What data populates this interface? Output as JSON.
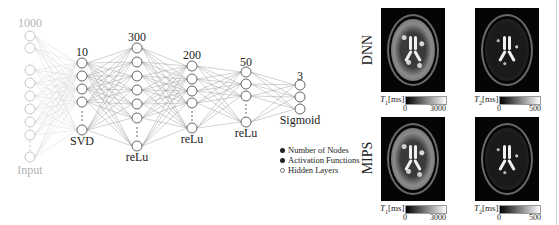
{
  "network": {
    "layers": [
      {
        "id": "input",
        "top_label": "1000",
        "bottom_label": "Input",
        "x": 30,
        "nodes": [
          36,
          48,
          70,
          83,
          96,
          109,
          122,
          135
        ],
        "dots_y": 146,
        "last_node": 157,
        "faded": true
      },
      {
        "id": "svd",
        "top_label": "10",
        "bottom_label": "SVD",
        "x": 82,
        "nodes": [
          63,
          76,
          89,
          102
        ],
        "dots_y": 116,
        "last_node": 130,
        "faded": false
      },
      {
        "id": "relu1",
        "top_label": "300",
        "bottom_label": "reLu",
        "x": 137,
        "nodes": [
          48,
          62,
          76,
          90,
          104,
          118
        ],
        "dots_y": 132,
        "last_node": 146,
        "faded": false
      },
      {
        "id": "relu2",
        "top_label": "200",
        "bottom_label": "reLu",
        "x": 192,
        "nodes": [
          66,
          79,
          91,
          103
        ],
        "dots_y": 116,
        "last_node": 128,
        "faded": false
      },
      {
        "id": "relu3",
        "top_label": "50",
        "bottom_label": "reLu",
        "x": 246,
        "nodes": [
          72,
          84,
          96
        ],
        "dots_y": 109,
        "last_node": 122,
        "faded": false
      },
      {
        "id": "sigmoid",
        "top_label": "3",
        "bottom_label": "Sigmoid",
        "x": 300,
        "nodes": [
          85,
          97,
          109
        ],
        "dots_y": null,
        "last_node": null,
        "faded": false
      }
    ]
  },
  "legend": {
    "items": [
      {
        "marker": "filled",
        "label": "Number of Nodes"
      },
      {
        "marker": "filled",
        "label": "Activation Functions"
      },
      {
        "marker": "hollow",
        "label": "Hidden Layers"
      }
    ]
  },
  "maps": {
    "rows": [
      {
        "label": "DNN",
        "panels": [
          {
            "type": "t1",
            "symbol": "T",
            "sub": "1",
            "unit": "[ms]",
            "min": "0",
            "max": "3000"
          },
          {
            "type": "t2",
            "symbol": "T",
            "sub": "2",
            "unit": "[ms]",
            "min": "0",
            "max": "500"
          }
        ]
      },
      {
        "label": "MIPS",
        "panels": [
          {
            "type": "t1",
            "symbol": "T",
            "sub": "1",
            "unit": "[ms]",
            "min": "0",
            "max": "3000"
          },
          {
            "type": "t2",
            "symbol": "T",
            "sub": "2",
            "unit": "[ms]",
            "min": "0",
            "max": "500"
          }
        ]
      }
    ]
  },
  "colors": {
    "edge": "#9a9a9a",
    "edge_faded": "#d6d6d6",
    "node_stroke": "#555555",
    "node_stroke_faded": "#c0c0c0",
    "text": "#222222",
    "text_faded": "#b4b4b4"
  }
}
